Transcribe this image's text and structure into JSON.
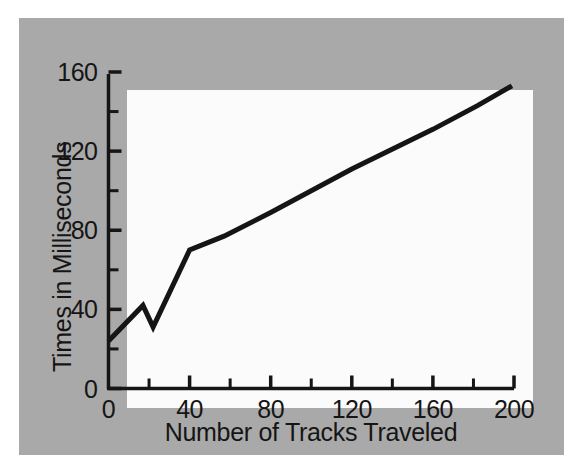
{
  "figure": {
    "panel_background": "#a9a9a9",
    "plot_background": "#fbfbfb",
    "ink_color": "#151515"
  },
  "chart_data": {
    "type": "line",
    "title": "",
    "xlabel": "Number of Tracks Traveled",
    "ylabel": "Times in Milliseconds",
    "xlim": [
      0,
      200
    ],
    "ylim": [
      0,
      160
    ],
    "grid": false,
    "legend": null,
    "x_major_ticks": [
      0,
      40,
      80,
      120,
      160,
      200
    ],
    "x_minor_ticks": [
      20,
      60,
      100,
      140,
      180
    ],
    "x_tick_labels": [
      "0",
      "40",
      "80",
      "120",
      "160",
      "200"
    ],
    "y_major_ticks": [
      0,
      40,
      80,
      120,
      160
    ],
    "y_minor_ticks": [
      20,
      60,
      100,
      140
    ],
    "y_tick_labels": [
      "0",
      "40",
      "80",
      "120",
      "160"
    ],
    "series": [
      {
        "name": "Seek time",
        "color": "#151515",
        "line_width": 5,
        "x": [
          0,
          17,
          22,
          40,
          57,
          80,
          120,
          160,
          182,
          199
        ],
        "y": [
          24,
          42,
          31,
          70,
          77,
          89,
          111,
          131,
          143,
          153
        ]
      }
    ]
  }
}
